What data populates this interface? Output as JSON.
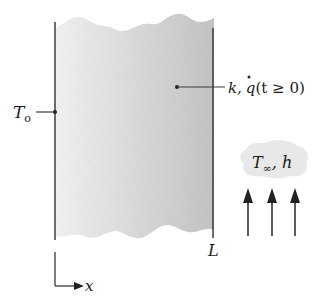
{
  "diagram": {
    "type": "plane wall with internal heat generation and convection",
    "left_surface_label": "T",
    "left_surface_subscript": "o",
    "property_label_k": "k,",
    "property_label_q": "q",
    "property_label_condition": "(t ≥ 0)",
    "right_surface_label": "L",
    "axis_label": "x",
    "fluid_label_T": "T",
    "fluid_label_subscript": "∞",
    "fluid_label_h": ", h",
    "arrow_count": 3,
    "colors": {
      "line": "#3a3a3a",
      "wall_fill_light": "#f2f2f2",
      "wall_fill_dark": "#c4c4c4",
      "cloud_fill": "#e6e6e6"
    }
  }
}
